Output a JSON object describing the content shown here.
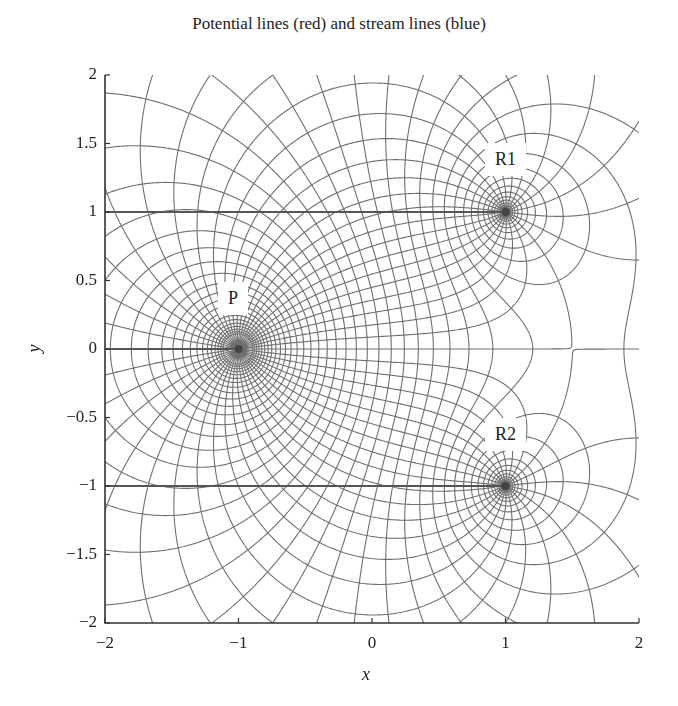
{
  "chart_data": {
    "type": "contour",
    "title": "Potential lines (red) and stream lines (blue)",
    "xlabel": "x",
    "ylabel": "y",
    "xlim": [
      -2,
      2
    ],
    "ylim": [
      -2,
      2
    ],
    "xticks": [
      "−2",
      "−1",
      "0",
      "1",
      "2"
    ],
    "xtick_values": [
      -2,
      -1,
      0,
      1,
      2
    ],
    "yticks": [
      "2",
      "1.5",
      "1",
      "0.5",
      "0",
      "−0.5",
      "−1",
      "−1.5",
      "−2"
    ],
    "ytick_values": [
      2,
      1.5,
      1,
      0.5,
      0,
      -0.5,
      -1,
      -1.5,
      -2
    ],
    "grid": false,
    "legend": null,
    "singularities": [
      {
        "label": "P",
        "x": -1,
        "y": 0,
        "strength": 2
      },
      {
        "label": "R1",
        "x": 1,
        "y": 1,
        "strength": -1
      },
      {
        "label": "R2",
        "x": 1,
        "y": -1,
        "strength": -1
      }
    ],
    "series": [
      {
        "name": "Potential lines",
        "color": "red (rendered gray)",
        "levels_step": 0.26
      },
      {
        "name": "Stream lines",
        "color": "blue (rendered gray)",
        "levels_step": 0.2618
      }
    ],
    "branch_cuts": [
      {
        "y": 1,
        "x_from": -2,
        "x_to": 1
      },
      {
        "y": 0,
        "x_from": -2,
        "x_to": -1
      },
      {
        "y": -1,
        "x_from": -2,
        "x_to": 1
      }
    ]
  },
  "labels": {
    "P": "P",
    "R1": "R1",
    "R2": "R2"
  },
  "style": {
    "line_color": "#6e6e6e",
    "axis_color": "#333333"
  }
}
